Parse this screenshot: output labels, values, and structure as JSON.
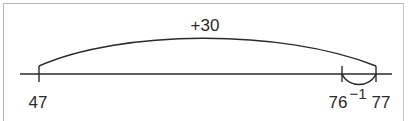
{
  "diagram": {
    "type": "open-number-line",
    "line_color": "#2a2a2a",
    "border_color": "#b8b8b8",
    "points": [
      {
        "label": "47",
        "value": 47
      },
      {
        "label": "76",
        "value": 76
      },
      {
        "label": "77",
        "value": 77
      }
    ],
    "jumps": [
      {
        "from": "47",
        "to": "77",
        "label": "+30",
        "position": "above"
      },
      {
        "from": "77",
        "to": "76",
        "label": "−1",
        "position": "below"
      }
    ]
  }
}
